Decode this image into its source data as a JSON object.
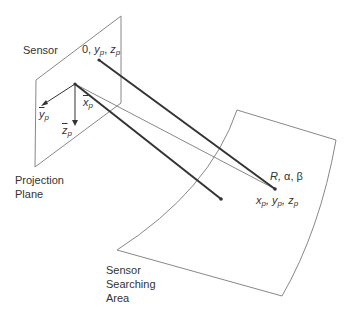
{
  "diagram": {
    "type": "geometry",
    "colors": {
      "stroke_thin": "#888888",
      "stroke_thick": "#333333",
      "text": "#333333"
    }
  },
  "labels": {
    "sensor": "Sensor",
    "sensor_origin": "0, y_p , z_p",
    "sensor_origin_parts": {
      "zero": "0,",
      "y": "y",
      "y_sub": "p",
      "comma": ",",
      "z": "z",
      "z_sub": "p"
    },
    "axis_x": {
      "base": "x",
      "sub": "p"
    },
    "axis_y": {
      "base": "y",
      "sub": "p"
    },
    "axis_z": {
      "base": "z",
      "sub": "p"
    },
    "projection_plane_line1": "Projection",
    "projection_plane_line2": "Plane",
    "polar": "R, α, β",
    "polar_parts": {
      "r": "R,",
      "alpha": "α,",
      "beta": "β"
    },
    "target_point": {
      "x": "x",
      "x_sub": "p",
      "y": "y",
      "y_sub": "p",
      "z": "z",
      "z_sub": "p"
    },
    "searching_area_line1": "Sensor",
    "searching_area_line2": "Searching",
    "searching_area_line3": "Area"
  }
}
